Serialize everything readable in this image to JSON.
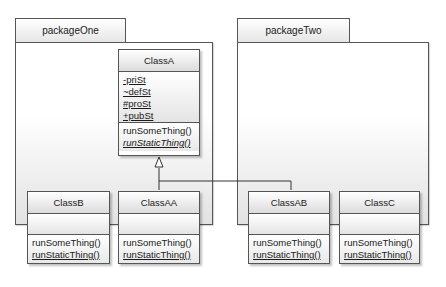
{
  "packages": [
    {
      "name": "packageOne"
    },
    {
      "name": "packageTwo"
    }
  ],
  "classes": {
    "classA": {
      "name": "ClassA",
      "attributes": [
        "-priSt",
        "~defSt",
        "#proSt",
        "+pubSt"
      ],
      "operations": [
        "runSomeThing()",
        "runStaticThing()"
      ]
    },
    "classB": {
      "name": "ClassB",
      "attributes": [],
      "operations": [
        "runSomeThing()",
        "runStaticThing()"
      ]
    },
    "classAA": {
      "name": "ClassAA",
      "attributes": [],
      "operations": [
        "runSomeThing()",
        "runStaticThing()"
      ]
    },
    "classAB": {
      "name": "ClassAB",
      "attributes": [],
      "operations": [
        "runSomeThing()",
        "runStaticThing()"
      ]
    },
    "classC": {
      "name": "ClassC",
      "attributes": [],
      "operations": [
        "runSomeThing()",
        "runStaticThing()"
      ]
    }
  },
  "relationships": [
    {
      "type": "generalization",
      "from": "ClassAA",
      "to": "ClassA"
    },
    {
      "type": "generalization",
      "from": "ClassAB",
      "to": "ClassA"
    }
  ],
  "colors": {
    "border": "#555555",
    "fill_top": "#ffffff",
    "fill_bottom": "#dcdcdc"
  }
}
